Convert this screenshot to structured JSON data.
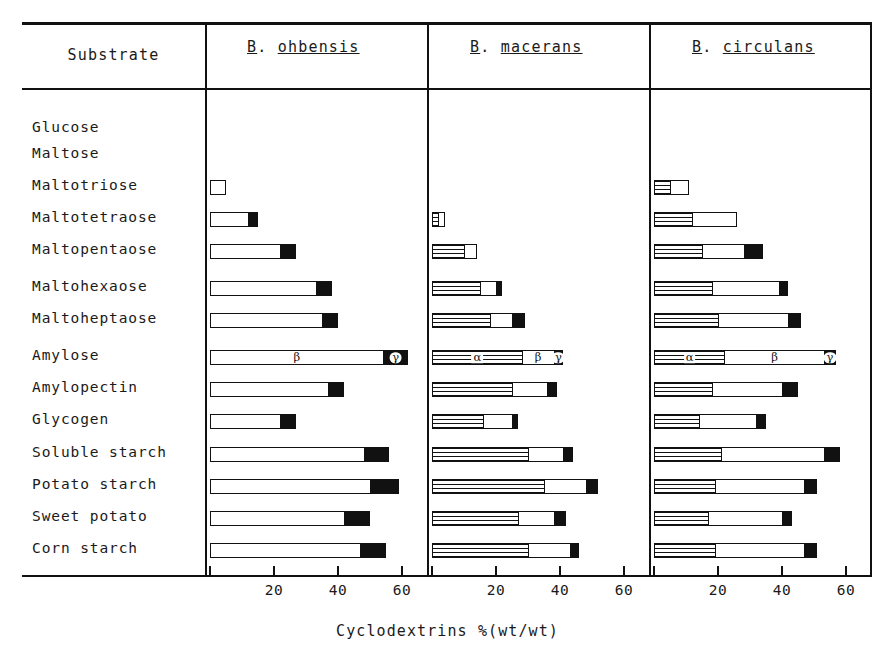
{
  "figure": {
    "substrate_header": "Substrate",
    "axis_title": "Cyclodextrins %(wt/wt)",
    "species": [
      {
        "initial": "B",
        "dot": ". ",
        "name": "ohbensis"
      },
      {
        "initial": "B",
        "dot": ". ",
        "name": "macerans"
      },
      {
        "initial": "B",
        "dot": ". ",
        "name": "circulans"
      }
    ]
  },
  "chart_data": {
    "type": "bar",
    "xlabel": "Cyclodextrins %(wt/wt)",
    "ylabel": "Substrate",
    "xlim": [
      0,
      70
    ],
    "xticks": [
      20,
      40,
      60
    ],
    "grid": false,
    "orientation": "horizontal",
    "stacked": true,
    "legend_position": "inline-annotations",
    "segment_names": [
      "alpha",
      "beta",
      "gamma"
    ],
    "segment_labels": [
      "α",
      "β",
      "γ"
    ],
    "segment_fills": [
      "hatched-horizontal-lines",
      "white",
      "black"
    ],
    "panels": [
      {
        "name": "B. ohbensis",
        "rows": [
          {
            "substrate": "Glucose",
            "alpha": 0,
            "beta": 0,
            "gamma": 0,
            "total": 0
          },
          {
            "substrate": "Maltose",
            "alpha": 0,
            "beta": 0,
            "gamma": 0,
            "total": 0
          },
          {
            "substrate": "Maltotriose",
            "alpha": 0,
            "beta": 5.0,
            "gamma": 0,
            "total": 5.0
          },
          {
            "substrate": "Maltotetraose",
            "alpha": 0,
            "beta": 12.0,
            "gamma": 3.0,
            "total": 15.0
          },
          {
            "substrate": "Maltopentaose",
            "alpha": 0,
            "beta": 22.0,
            "gamma": 5.0,
            "total": 27.0
          },
          {
            "substrate": "Maltohexaose",
            "alpha": 0,
            "beta": 33.0,
            "gamma": 5.0,
            "total": 38.0
          },
          {
            "substrate": "Maltoheptaose",
            "alpha": 0,
            "beta": 35.0,
            "gamma": 5.0,
            "total": 40.0
          },
          {
            "substrate": "Amylose",
            "alpha": 0,
            "beta": 54.0,
            "gamma": 8.0,
            "total": 62.0
          },
          {
            "substrate": "Amylopectin",
            "alpha": 0,
            "beta": 37.0,
            "gamma": 5.0,
            "total": 42.0
          },
          {
            "substrate": "Glycogen",
            "alpha": 0,
            "beta": 22.0,
            "gamma": 5.0,
            "total": 27.0
          },
          {
            "substrate": "Soluble starch",
            "alpha": 0,
            "beta": 48.0,
            "gamma": 8.0,
            "total": 56.0
          },
          {
            "substrate": "Potato starch",
            "alpha": 0,
            "beta": 50.0,
            "gamma": 9.0,
            "total": 59.0
          },
          {
            "substrate": "Sweet potato",
            "alpha": 0,
            "beta": 42.0,
            "gamma": 8.0,
            "total": 50.0
          },
          {
            "substrate": "Corn starch",
            "alpha": 0,
            "beta": 47.0,
            "gamma": 8.0,
            "total": 55.0
          }
        ]
      },
      {
        "name": "B. macerans",
        "rows": [
          {
            "substrate": "Glucose",
            "alpha": 0,
            "beta": 0,
            "gamma": 0,
            "total": 0
          },
          {
            "substrate": "Maltose",
            "alpha": 0,
            "beta": 0,
            "gamma": 0,
            "total": 0
          },
          {
            "substrate": "Maltotriose",
            "alpha": 0,
            "beta": 0,
            "gamma": 0,
            "total": 0
          },
          {
            "substrate": "Maltotetraose",
            "alpha": 2.0,
            "beta": 2.0,
            "gamma": 0,
            "total": 4.0
          },
          {
            "substrate": "Maltopentaose",
            "alpha": 10.0,
            "beta": 4.0,
            "gamma": 0,
            "total": 14.0
          },
          {
            "substrate": "Maltohexaose",
            "alpha": 15.0,
            "beta": 5.0,
            "gamma": 2.0,
            "total": 22.0
          },
          {
            "substrate": "Maltoheptaose",
            "alpha": 18.0,
            "beta": 7.0,
            "gamma": 4.0,
            "total": 29.0
          },
          {
            "substrate": "Amylose",
            "alpha": 28.0,
            "beta": 10.0,
            "gamma": 3.0,
            "total": 41.0
          },
          {
            "substrate": "Amylopectin",
            "alpha": 25.0,
            "beta": 11.0,
            "gamma": 3.0,
            "total": 39.0
          },
          {
            "substrate": "Glycogen",
            "alpha": 16.0,
            "beta": 9.0,
            "gamma": 2.0,
            "total": 27.0
          },
          {
            "substrate": "Soluble starch",
            "alpha": 30.0,
            "beta": 11.0,
            "gamma": 3.0,
            "total": 44.0
          },
          {
            "substrate": "Potato starch",
            "alpha": 35.0,
            "beta": 13.0,
            "gamma": 4.0,
            "total": 52.0
          },
          {
            "substrate": "Sweet potato",
            "alpha": 27.0,
            "beta": 11.0,
            "gamma": 4.0,
            "total": 42.0
          },
          {
            "substrate": "Corn starch",
            "alpha": 30.0,
            "beta": 13.0,
            "gamma": 3.0,
            "total": 46.0
          }
        ]
      },
      {
        "name": "B. circulans",
        "rows": [
          {
            "substrate": "Glucose",
            "alpha": 0,
            "beta": 0,
            "gamma": 0,
            "total": 0
          },
          {
            "substrate": "Maltose",
            "alpha": 0,
            "beta": 0,
            "gamma": 0,
            "total": 0
          },
          {
            "substrate": "Maltotriose",
            "alpha": 5.0,
            "beta": 6.0,
            "gamma": 0,
            "total": 11.0
          },
          {
            "substrate": "Maltotetraose",
            "alpha": 12.0,
            "beta": 14.0,
            "gamma": 0,
            "total": 26.0
          },
          {
            "substrate": "Maltopentaose",
            "alpha": 15.0,
            "beta": 13.0,
            "gamma": 6.0,
            "total": 34.0
          },
          {
            "substrate": "Maltohexaose",
            "alpha": 18.0,
            "beta": 21.0,
            "gamma": 3.0,
            "total": 42.0
          },
          {
            "substrate": "Maltoheptaose",
            "alpha": 20.0,
            "beta": 22.0,
            "gamma": 4.0,
            "total": 46.0
          },
          {
            "substrate": "Amylose",
            "alpha": 22.0,
            "beta": 31.0,
            "gamma": 4.0,
            "total": 57.0
          },
          {
            "substrate": "Amylopectin",
            "alpha": 18.0,
            "beta": 22.0,
            "gamma": 5.0,
            "total": 45.0
          },
          {
            "substrate": "Glycogen",
            "alpha": 14.0,
            "beta": 18.0,
            "gamma": 3.0,
            "total": 35.0
          },
          {
            "substrate": "Soluble starch",
            "alpha": 21.0,
            "beta": 32.0,
            "gamma": 5.0,
            "total": 58.0
          },
          {
            "substrate": "Potato starch",
            "alpha": 19.0,
            "beta": 28.0,
            "gamma": 4.0,
            "total": 51.0
          },
          {
            "substrate": "Sweet potato",
            "alpha": 17.0,
            "beta": 23.0,
            "gamma": 3.0,
            "total": 43.0
          },
          {
            "substrate": "Corn starch",
            "alpha": 19.0,
            "beta": 28.0,
            "gamma": 4.0,
            "total": 51.0
          }
        ]
      }
    ],
    "annotations": [
      {
        "panel": 0,
        "row": "Amylose",
        "segment": "beta",
        "label": "β"
      },
      {
        "panel": 0,
        "row": "Amylose",
        "segment": "gamma",
        "label": "γ"
      },
      {
        "panel": 1,
        "row": "Amylose",
        "segment": "alpha",
        "label": "α"
      },
      {
        "panel": 1,
        "row": "Amylose",
        "segment": "beta",
        "label": "β"
      },
      {
        "panel": 1,
        "row": "Amylose",
        "segment": "gamma",
        "label": "γ"
      },
      {
        "panel": 2,
        "row": "Amylose",
        "segment": "alpha",
        "label": "α"
      },
      {
        "panel": 2,
        "row": "Amylose",
        "segment": "beta",
        "label": "β"
      },
      {
        "panel": 2,
        "row": "Amylose",
        "segment": "gamma",
        "label": "γ"
      }
    ]
  },
  "layout": {
    "panel_x0": [
      210,
      432,
      654
    ],
    "px_per_unit": 3.2,
    "row_y": [
      122,
      148,
      180,
      212,
      244,
      281,
      313,
      350,
      382,
      414,
      447,
      479,
      511,
      543
    ],
    "tick_values": [
      20,
      40,
      60
    ]
  }
}
